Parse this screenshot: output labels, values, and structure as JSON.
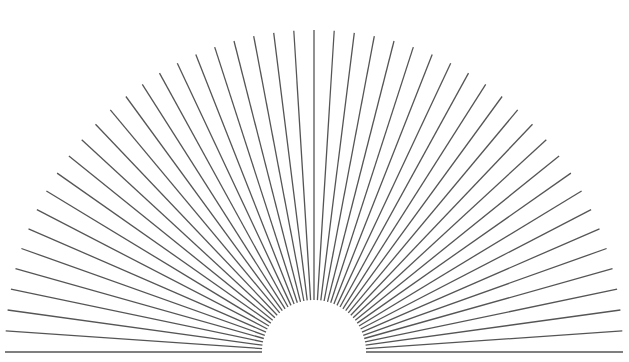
{
  "diagram": {
    "type": "radial-sunburst-lines",
    "background": "#ffffff",
    "stroke_color": "#555555",
    "stroke_width": 1.3,
    "center": {
      "x": 314,
      "y": 352
    },
    "inner_radius": 52,
    "outer_radius_x": 309,
    "outer_radius_y": 322,
    "ray_count": 49,
    "angle_start_deg": 0,
    "angle_end_deg": 180
  }
}
